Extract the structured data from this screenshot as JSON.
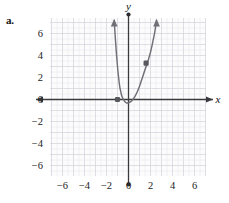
{
  "part_label": "a.",
  "axes": {
    "x_name": "x",
    "y_name": "y"
  },
  "chart_data": {
    "type": "line",
    "title": "",
    "xlabel": "x",
    "ylabel": "y",
    "grid": true,
    "legend": null,
    "xlim": [
      -8,
      7
    ],
    "ylim": [
      -7.5,
      7.5
    ],
    "xticks": [
      -6,
      -4,
      -2,
      0,
      2,
      4,
      6
    ],
    "yticks": [
      6,
      4,
      2,
      0,
      -2,
      -4,
      -6
    ],
    "xtick_labels": [
      "−6",
      "−4",
      "−2",
      "0",
      "2",
      "4",
      "6"
    ],
    "ytick_labels": [
      "6",
      "4",
      "2",
      "0",
      "−2",
      "−4",
      "−6"
    ],
    "series": [
      {
        "name": "parabola",
        "type": "curve",
        "color": "#6f6f76",
        "arrow_start": true,
        "arrow_end": true,
        "points": [
          [
            -1.3,
            7.2
          ],
          [
            -1.2,
            5.6
          ],
          [
            -1.1,
            4.2
          ],
          [
            -1.0,
            3.0
          ],
          [
            -0.9,
            2.0
          ],
          [
            -0.8,
            1.2
          ],
          [
            -0.7,
            0.7
          ],
          [
            -0.6,
            0.3
          ],
          [
            -0.4,
            -0.1
          ],
          [
            -0.2,
            -0.3
          ],
          [
            0.0,
            -0.3
          ],
          [
            0.2,
            -0.2
          ],
          [
            0.4,
            0.0
          ],
          [
            0.6,
            0.3
          ],
          [
            0.8,
            0.7
          ],
          [
            1.0,
            1.2
          ],
          [
            1.2,
            1.8
          ],
          [
            1.4,
            2.4
          ],
          [
            1.6,
            3.0
          ],
          [
            1.8,
            3.6
          ],
          [
            2.0,
            4.3
          ],
          [
            2.2,
            5.2
          ],
          [
            2.4,
            6.2
          ],
          [
            2.55,
            7.2
          ]
        ]
      }
    ],
    "marked_points": [
      {
        "label": "",
        "x": -1.0,
        "y": 0.0,
        "color": "#57575e"
      },
      {
        "label": "",
        "x": 1.6,
        "y": 3.3,
        "color": "#57575e"
      }
    ],
    "annotations": []
  }
}
